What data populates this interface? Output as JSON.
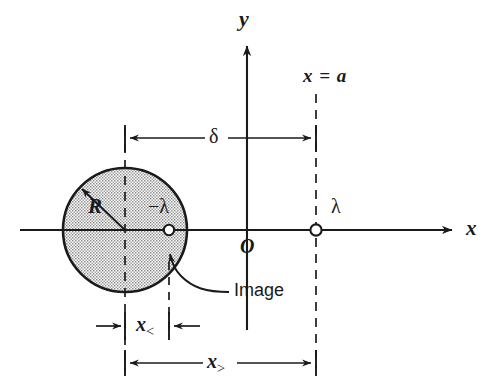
{
  "figure": {
    "type": "physics-diagram",
    "background_color": "#ffffff",
    "ink_color": "#1a1a1a",
    "fill_color": "#c9c9c9"
  },
  "axes": {
    "x_axis_label": "x",
    "y_axis_label": "y",
    "origin_label": "O"
  },
  "labels": {
    "radius": "R",
    "image_charge": "−λ",
    "real_charge": "λ",
    "plane_line": "x = a",
    "gap": "δ",
    "image_callout": "Image"
  },
  "dimensions": [
    {
      "name": "x-less",
      "base": "x",
      "subscript": "<"
    },
    {
      "name": "x-greater",
      "base": "x",
      "subscript": ">"
    }
  ],
  "geometry": {
    "cylinder_center_x": 125,
    "cylinder_center_y": 230,
    "cylinder_radius": 62,
    "image_charge_x": 169,
    "image_charge_y": 230,
    "real_charge_x": 316,
    "real_charge_y": 230,
    "origin_x": 247,
    "origin_y": 230
  }
}
